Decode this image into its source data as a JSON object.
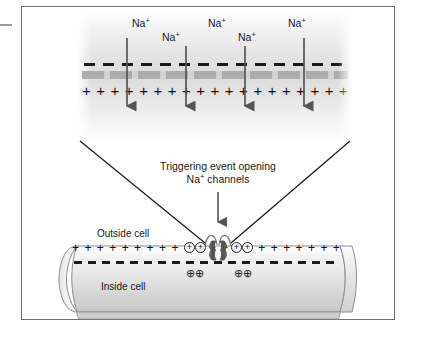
{
  "figure": {
    "frame_border_color": "#6e6e6e",
    "background_color": "#ffffff"
  },
  "magnified_panel": {
    "membrane_outer_charge_symbol": "–",
    "membrane_inner_charge_symbol": "+",
    "plus_row_count": 19,
    "lipid_band_color": "#a8a8a8",
    "sodium_labels": [
      {
        "text": "Na",
        "sup": "+",
        "x": 132,
        "y": 18
      },
      {
        "text": "Na",
        "sup": "+",
        "x": 162,
        "y": 32
      },
      {
        "text": "Na",
        "sup": "+",
        "x": 208,
        "y": 18
      },
      {
        "text": "Na",
        "sup": "+",
        "x": 238,
        "y": 32
      },
      {
        "text": "Na",
        "sup": "+",
        "x": 288,
        "y": 18
      }
    ],
    "arrows": [
      {
        "x": 127,
        "y_start": 38,
        "y_end": 112
      },
      {
        "x": 186,
        "y_start": 45,
        "y_end": 112
      },
      {
        "x": 245,
        "y_start": 45,
        "y_end": 112
      },
      {
        "x": 304,
        "y_start": 38,
        "y_end": 112
      }
    ],
    "arrow_color": "#555555"
  },
  "trigger": {
    "line1": "Triggering event opening",
    "line2_prefix": "Na",
    "line2_sup": "+",
    "line2_suffix": " channels",
    "arrow_direction": "down"
  },
  "cell": {
    "outside_label": "Outside cell",
    "inside_label": "Inside cell",
    "outer_charge_symbol": "+",
    "inner_charge_symbol": "–",
    "outer_plus_count": 22,
    "entering_ion_symbol": "+",
    "entering_ion_count": 4,
    "intracellular_ion_symbol": "⊕⊕",
    "intracellular_ion_groups": 2,
    "tube_fill_light": "#f5f5f5",
    "tube_fill_mid": "#d8d8d8",
    "tube_outline": "#8e8e8e"
  },
  "channel": {
    "name": "sodium-channel-protein",
    "state": "open",
    "color": "#555555"
  },
  "colors": {
    "ink": "#1a1a1a",
    "arrow": "#555555",
    "membrane_grey": "#a8a8a8",
    "frame": "#6e6e6e"
  }
}
